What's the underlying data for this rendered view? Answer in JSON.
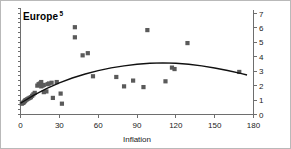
{
  "chart_data": {
    "type": "scatter",
    "title": "Europe",
    "title_superscript": "5",
    "xlabel": "Inflation",
    "ylabel": "",
    "xlim": [
      0,
      180
    ],
    "ylim": [
      0,
      7
    ],
    "xticks": [
      0,
      30,
      60,
      90,
      120,
      150,
      180
    ],
    "xticklabels": [
      "0",
      "30",
      "60",
      "90",
      "120",
      "150",
      "180"
    ],
    "yticks": [
      0,
      1,
      2,
      3,
      4,
      5,
      6,
      7
    ],
    "yticklabels": [
      "0",
      "1",
      "2",
      "3",
      "4",
      "5",
      "6",
      "7"
    ],
    "y_axis_position": "right",
    "left_axis_ticks_unlabeled": true,
    "grid": false,
    "legend": "none",
    "marker_style": "filled-square",
    "marker_color": "#5a5a5a",
    "fit_line_color": "#111111",
    "fit_line_label": "quadratic trend",
    "points": [
      {
        "x": 1,
        "y": 0.75
      },
      {
        "x": 2,
        "y": 0.8
      },
      {
        "x": 2.5,
        "y": 0.85
      },
      {
        "x": 3,
        "y": 0.9
      },
      {
        "x": 3.5,
        "y": 0.95
      },
      {
        "x": 4,
        "y": 1.0
      },
      {
        "x": 5,
        "y": 1.05
      },
      {
        "x": 6,
        "y": 1.1
      },
      {
        "x": 7,
        "y": 1.15
      },
      {
        "x": 8,
        "y": 1.2
      },
      {
        "x": 9,
        "y": 1.3
      },
      {
        "x": 10,
        "y": 1.4
      },
      {
        "x": 11,
        "y": 1.5
      },
      {
        "x": 13,
        "y": 2.0
      },
      {
        "x": 14,
        "y": 2.1
      },
      {
        "x": 15,
        "y": 2.15
      },
      {
        "x": 16,
        "y": 2.25
      },
      {
        "x": 16,
        "y": 1.95
      },
      {
        "x": 17,
        "y": 2.0
      },
      {
        "x": 18,
        "y": 2.05
      },
      {
        "x": 18,
        "y": 1.55
      },
      {
        "x": 20,
        "y": 1.6
      },
      {
        "x": 21,
        "y": 2.1
      },
      {
        "x": 22,
        "y": 2.15
      },
      {
        "x": 24,
        "y": 2.2
      },
      {
        "x": 25,
        "y": 1.15
      },
      {
        "x": 28,
        "y": 2.25
      },
      {
        "x": 31,
        "y": 1.45
      },
      {
        "x": 32,
        "y": 0.75
      },
      {
        "x": 42,
        "y": 6.05
      },
      {
        "x": 42,
        "y": 5.35
      },
      {
        "x": 48,
        "y": 4.1
      },
      {
        "x": 52,
        "y": 4.25
      },
      {
        "x": 56,
        "y": 2.65
      },
      {
        "x": 74,
        "y": 2.6
      },
      {
        "x": 80,
        "y": 1.95
      },
      {
        "x": 87,
        "y": 2.35
      },
      {
        "x": 95,
        "y": 1.9
      },
      {
        "x": 98,
        "y": 5.85
      },
      {
        "x": 112,
        "y": 2.3
      },
      {
        "x": 117,
        "y": 3.25
      },
      {
        "x": 119,
        "y": 3.15
      },
      {
        "x": 129,
        "y": 4.95
      },
      {
        "x": 169,
        "y": 2.95
      }
    ],
    "fit_curve": [
      {
        "x": 0,
        "y": 0.78
      },
      {
        "x": 10,
        "y": 1.32
      },
      {
        "x": 20,
        "y": 1.79
      },
      {
        "x": 30,
        "y": 2.19
      },
      {
        "x": 40,
        "y": 2.53
      },
      {
        "x": 50,
        "y": 2.81
      },
      {
        "x": 60,
        "y": 3.04
      },
      {
        "x": 70,
        "y": 3.23
      },
      {
        "x": 80,
        "y": 3.37
      },
      {
        "x": 90,
        "y": 3.48
      },
      {
        "x": 100,
        "y": 3.55
      },
      {
        "x": 110,
        "y": 3.58
      },
      {
        "x": 120,
        "y": 3.55
      },
      {
        "x": 130,
        "y": 3.48
      },
      {
        "x": 140,
        "y": 3.37
      },
      {
        "x": 150,
        "y": 3.22
      },
      {
        "x": 160,
        "y": 3.05
      },
      {
        "x": 170,
        "y": 2.85
      },
      {
        "x": 175,
        "y": 2.74
      }
    ]
  }
}
